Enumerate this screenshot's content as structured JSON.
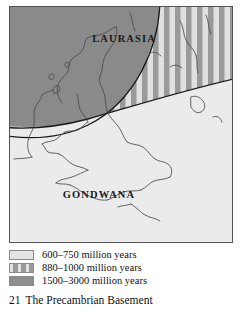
{
  "figure": {
    "caption_number": "21",
    "caption_title": "The Precambrian Basement"
  },
  "map": {
    "labels": {
      "laurasia": "LAURASIA",
      "gondwana": "GONDWANA"
    },
    "colors": {
      "frame_border": "#555555",
      "background": "#e9e9e9",
      "laurasia_fill": "#8a8a8a",
      "gondwana_fill": "#ebebeb",
      "stripe_dark": "#9a9a9a",
      "stripe_light": "#e0e0e0",
      "coastline": "#4a4a4a",
      "boundary": "#1a1a1a"
    }
  },
  "legend": {
    "items": [
      {
        "pattern": "solid-light",
        "label": "600–750 million years"
      },
      {
        "pattern": "vertical-stripes",
        "label": "880–1000 million years"
      },
      {
        "pattern": "solid-dark",
        "label": "1500–3000 million years"
      }
    ]
  }
}
